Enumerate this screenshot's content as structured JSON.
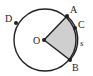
{
  "diagram": {
    "type": "circle-sector",
    "center": {
      "label": "O",
      "x": 44,
      "y": 40
    },
    "radius": 31,
    "points": [
      {
        "label": "A",
        "x": 67,
        "y": 16
      },
      {
        "label": "C",
        "x": 75,
        "y": 28
      },
      {
        "label": "B",
        "x": 70,
        "y": 60
      },
      {
        "label": "D",
        "x": 16,
        "y": 23
      }
    ],
    "shaded_sector": [
      "O",
      "A",
      "B"
    ],
    "arc_label": "s",
    "colors": {
      "stroke": "#222222",
      "fill": "#cfcfcf"
    }
  }
}
